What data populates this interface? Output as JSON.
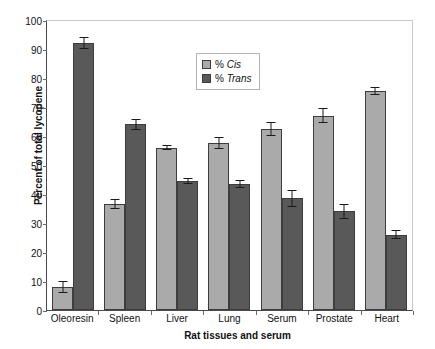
{
  "chart_data": {
    "type": "bar",
    "title": "",
    "xlabel": "Rat tissues and serum",
    "ylabel": "Percent of total lycopene",
    "ylim": [
      0,
      100
    ],
    "ytick_step": 10,
    "yticks": [
      0,
      10,
      20,
      30,
      40,
      50,
      60,
      70,
      80,
      90,
      100
    ],
    "grid": false,
    "legend_position": "inside-top-center",
    "categories": [
      "Oleoresin",
      "Spleen",
      "Liver",
      "Lung",
      "Serum",
      "Prostate",
      "Heart"
    ],
    "series": [
      {
        "name": "% Cis",
        "color": "#aaaaaa",
        "values": [
          8,
          36.5,
          56,
          57.5,
          62.5,
          67,
          75.5
        ],
        "errors": [
          2,
          1.8,
          0.8,
          2,
          2.5,
          2.5,
          1.5
        ]
      },
      {
        "name": "% Trans",
        "color": "#595959",
        "values": [
          92,
          64,
          44.5,
          43.5,
          38.5,
          34,
          26
        ],
        "errors": [
          2,
          2,
          1,
          1.5,
          3,
          2.5,
          1.5
        ]
      }
    ]
  },
  "legend": {
    "items": [
      {
        "pct": "% ",
        "label": "Cis"
      },
      {
        "pct": "% ",
        "label": "Trans"
      }
    ]
  },
  "axes": {
    "y_title": "Percent of total lycopene",
    "x_title": "Rat tissues and serum",
    "y_tick_labels": [
      "100",
      "90",
      "80",
      "70",
      "60",
      "50",
      "40",
      "30",
      "20",
      "10",
      "0"
    ],
    "x_tick_labels": [
      "Oleoresin",
      "Spleen",
      "Liver",
      "Lung",
      "Serum",
      "Prostate",
      "Heart"
    ]
  }
}
